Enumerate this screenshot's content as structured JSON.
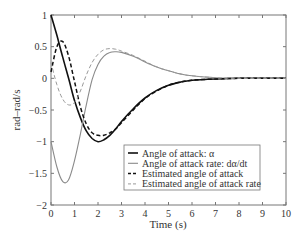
{
  "chart_data": {
    "type": "line",
    "title": "",
    "xlabel": "Time (s)",
    "ylabel": "rad–rad/s",
    "xlim": [
      0,
      10
    ],
    "ylim": [
      -2,
      1
    ],
    "grid": false,
    "legend_position": "lower right",
    "x_ticks": [
      "0",
      "1",
      "2",
      "3",
      "4",
      "5",
      "6",
      "7",
      "8",
      "9",
      "10"
    ],
    "y_ticks": [
      "1",
      "0.5",
      "0",
      "−0.5",
      "−1",
      "−1.5",
      "−2"
    ],
    "x": [
      0,
      0.25,
      0.5,
      0.75,
      1.0,
      1.25,
      1.5,
      1.75,
      2.0,
      2.25,
      2.5,
      2.75,
      3.0,
      3.5,
      4.0,
      4.5,
      5.0,
      5.5,
      6.0,
      7.0,
      8.0,
      9.0,
      10.0
    ],
    "series": [
      {
        "name": "Angle of attack: α",
        "style": "solid",
        "color": "#111111",
        "values": [
          1.0,
          0.68,
          0.33,
          0.0,
          -0.35,
          -0.62,
          -0.83,
          -0.95,
          -1.0,
          -0.97,
          -0.9,
          -0.8,
          -0.68,
          -0.48,
          -0.31,
          -0.19,
          -0.11,
          -0.06,
          -0.03,
          -0.01,
          0.0,
          0.0,
          0.0
        ]
      },
      {
        "name": "Angle of attack rate: dα/dt",
        "style": "solid",
        "color": "#8a8a8a",
        "values": [
          -1.0,
          -1.4,
          -1.63,
          -1.6,
          -1.3,
          -0.88,
          -0.42,
          -0.02,
          0.22,
          0.35,
          0.41,
          0.42,
          0.41,
          0.35,
          0.26,
          0.18,
          0.12,
          0.07,
          0.04,
          0.01,
          0.0,
          0.0,
          0.0
        ]
      },
      {
        "name": "Estimated angle of attack",
        "style": "dashed",
        "color": "#111111",
        "values": [
          0.1,
          0.5,
          0.58,
          0.35,
          -0.05,
          -0.45,
          -0.72,
          -0.86,
          -0.9,
          -0.9,
          -0.86,
          -0.8,
          -0.7,
          -0.5,
          -0.32,
          -0.2,
          -0.11,
          -0.06,
          -0.03,
          -0.01,
          0.0,
          0.0,
          0.0
        ]
      },
      {
        "name": "Estimated angle of attack rate",
        "style": "dashed",
        "color": "#9a9a9a",
        "values": [
          0.25,
          -0.1,
          -0.33,
          -0.42,
          -0.38,
          -0.2,
          0.05,
          0.25,
          0.38,
          0.45,
          0.47,
          0.46,
          0.43,
          0.36,
          0.27,
          0.18,
          0.12,
          0.07,
          0.04,
          0.01,
          0.0,
          0.0,
          0.0
        ]
      }
    ]
  }
}
